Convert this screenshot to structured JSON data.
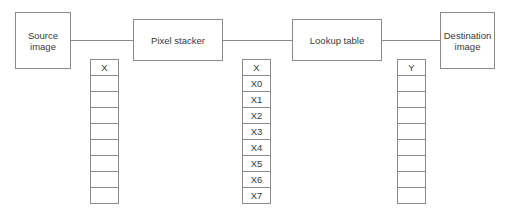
{
  "nodes": {
    "source": {
      "label_line1": "Source",
      "label_line2": "image"
    },
    "stacker": {
      "label": "Pixel stacker"
    },
    "lookup": {
      "label": "Lookup table"
    },
    "destination": {
      "label_line1": "Destination",
      "label_line2": "image"
    }
  },
  "columns": {
    "left": {
      "header": "X",
      "cells": [
        "",
        "",
        "",
        "",
        "",
        "",
        "",
        ""
      ]
    },
    "middle": {
      "header": "X",
      "cells": [
        "X0",
        "X1",
        "X2",
        "X3",
        "X4",
        "X5",
        "X6",
        "X7"
      ]
    },
    "right": {
      "header": "Y",
      "cells": [
        "",
        "",
        "",
        "",
        "",
        "",
        "",
        ""
      ]
    }
  },
  "colors": {
    "stroke": "#8a8a8a",
    "text": "#3a3a3a"
  }
}
